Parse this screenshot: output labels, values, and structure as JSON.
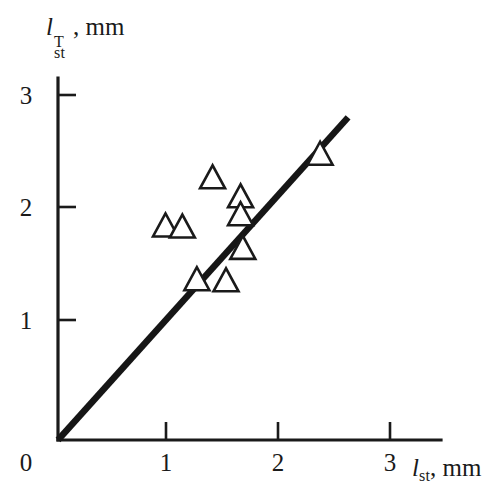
{
  "chart_data": {
    "type": "scatter",
    "title": "",
    "subtitle": "",
    "xlabel": "l_st, mm",
    "ylabel": "l_st^T, mm",
    "xlabel_parts": {
      "variable": "l",
      "subscript": "st",
      "superscript": "",
      "separator": ", ",
      "unit": "mm"
    },
    "ylabel_parts": {
      "variable": "l",
      "subscript": "st",
      "superscript": "T",
      "separator": ", ",
      "unit": "mm"
    },
    "xlim": [
      0,
      3.4
    ],
    "ylim": [
      0,
      3.15
    ],
    "xticks": [
      1,
      2,
      3
    ],
    "yticks": [
      1,
      2,
      3
    ],
    "xtick_labels": [
      "1",
      "2",
      "3"
    ],
    "ytick_labels": [
      "1",
      "2",
      "3"
    ],
    "origin_label": "0",
    "grid": false,
    "legend": null,
    "marker": "open-triangle",
    "series": [
      {
        "name": "measurements",
        "marker": "open-triangle",
        "points": [
          {
            "x": 0.96,
            "y": 1.91
          },
          {
            "x": 1.11,
            "y": 1.9
          },
          {
            "x": 1.38,
            "y": 2.34
          },
          {
            "x": 1.63,
            "y": 2.17
          },
          {
            "x": 1.63,
            "y": 2.01
          },
          {
            "x": 1.65,
            "y": 1.71
          },
          {
            "x": 1.24,
            "y": 1.43
          },
          {
            "x": 1.5,
            "y": 1.42
          },
          {
            "x": 2.34,
            "y": 2.55
          }
        ]
      },
      {
        "name": "parity-line",
        "type": "line",
        "x": [
          0.0,
          2.59
        ],
        "y": [
          0.0,
          2.88
        ]
      }
    ]
  },
  "axes": {
    "x_tick_values": [
      "1",
      "2",
      "3"
    ],
    "y_tick_values": [
      "1",
      "2",
      "3"
    ],
    "zero_label": "0"
  },
  "colors": {
    "ink": "#1a1a1a",
    "background": "#ffffff",
    "marker_stroke": "#1a1a1a",
    "line": "#161616"
  }
}
